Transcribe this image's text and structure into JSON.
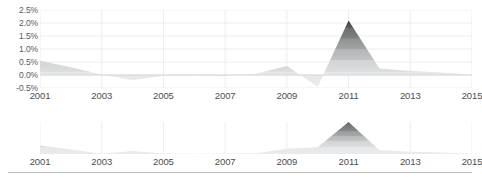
{
  "chart_data": [
    {
      "id": "main",
      "type": "area",
      "title": "",
      "xlabel": "",
      "ylabel": "",
      "grid": true,
      "legend_position": "none",
      "xlim": [
        2001,
        2015
      ],
      "ylim": [
        -0.5,
        2.5
      ],
      "ytick_labels": [
        "2.5%",
        "2.0%",
        "1.5%",
        "1.0%",
        "0.5%",
        "0.0%",
        "-0.5%"
      ],
      "ytick_values": [
        2.5,
        2.0,
        1.5,
        1.0,
        0.5,
        0.0,
        -0.5
      ],
      "xtick_labels": [
        "2001",
        "2003",
        "2005",
        "2007",
        "2009",
        "2011",
        "2013",
        "2015"
      ],
      "xtick_values": [
        2001,
        2003,
        2005,
        2007,
        2009,
        2011,
        2013,
        2015
      ],
      "x": [
        2001,
        2002,
        2003,
        2004,
        2005,
        2006,
        2007,
        2008,
        2009,
        2010,
        2011,
        2012,
        2013,
        2014,
        2015
      ],
      "values": [
        0.55,
        0.3,
        0.02,
        -0.2,
        -0.03,
        -0.02,
        -0.04,
        0.05,
        0.35,
        -0.45,
        2.1,
        0.25,
        0.15,
        0.1,
        0.02
      ],
      "series": [
        {
          "name": "value",
          "values": [
            0.55,
            0.3,
            0.02,
            -0.2,
            -0.03,
            -0.02,
            -0.04,
            0.05,
            0.35,
            -0.45,
            2.1,
            0.25,
            0.15,
            0.1,
            0.02
          ]
        }
      ]
    },
    {
      "id": "sub",
      "type": "area",
      "title": "",
      "xlabel": "",
      "ylabel": "",
      "grid": true,
      "legend_position": "none",
      "xlim": [
        2001,
        2015
      ],
      "ylim": [
        0,
        2.1
      ],
      "ytick_labels": [],
      "ytick_values": [],
      "xtick_labels": [
        "2001",
        "2003",
        "2005",
        "2007",
        "2009",
        "2011",
        "2013",
        "2015"
      ],
      "xtick_values": [
        2001,
        2003,
        2005,
        2007,
        2009,
        2011,
        2013,
        2015
      ],
      "x": [
        2001,
        2002,
        2003,
        2004,
        2005,
        2006,
        2007,
        2008,
        2009,
        2010,
        2011,
        2012,
        2013,
        2014,
        2015
      ],
      "values": [
        0.55,
        0.3,
        0.02,
        0.2,
        0.03,
        0.02,
        0.04,
        0.05,
        0.35,
        0.45,
        2.1,
        0.25,
        0.15,
        0.1,
        0.02
      ],
      "series": [
        {
          "name": "magnitude",
          "values": [
            0.55,
            0.3,
            0.02,
            0.2,
            0.03,
            0.02,
            0.04,
            0.05,
            0.35,
            0.45,
            2.1,
            0.25,
            0.15,
            0.1,
            0.02
          ]
        }
      ]
    }
  ],
  "colors": {
    "fill_light": "#e6e7e8",
    "fill_mid": "#b4b5b7",
    "fill_dark": "#6d6e70",
    "grid": "#eceded",
    "zero_line": "#d8d9da",
    "axis_text": "#4c4d4f",
    "ytick_text": "#58595b",
    "rule": "#bcbdbf",
    "background": "#ffffff"
  }
}
